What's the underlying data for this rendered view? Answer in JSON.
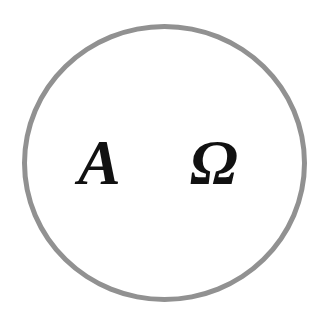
{
  "diagram": {
    "shape": "circle",
    "ring_color": "#919191",
    "text_color": "#111111",
    "symbols": [
      {
        "label": "A",
        "name": "alpha"
      },
      {
        "label": "Ω",
        "name": "omega"
      }
    ]
  }
}
